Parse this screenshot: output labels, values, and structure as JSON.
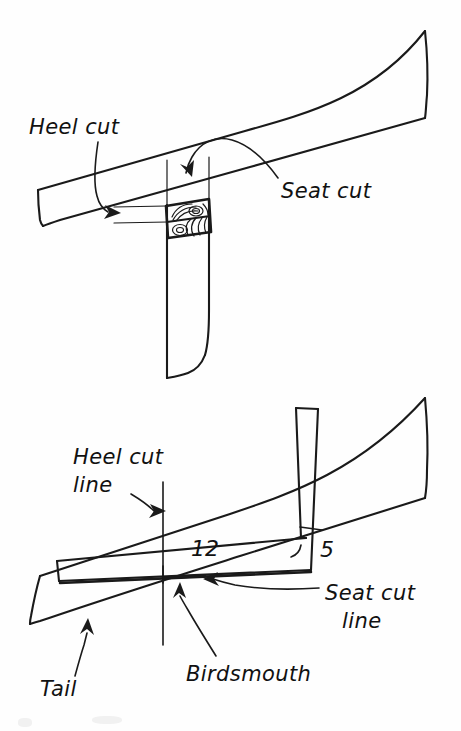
{
  "figure": {
    "style": "hand-drawn pen-and-ink line illustration",
    "background_color": "#fefefe",
    "ink_color": "#1a1a1a"
  },
  "panels": [
    {
      "id": "upper",
      "description": "Perspective view of a sloped rafter seated on a vertical wall top plate with a birdsmouth notch showing end grain",
      "labels": [
        "heel_cut",
        "seat_cut"
      ]
    },
    {
      "id": "lower",
      "description": "Framing square laid across a sloped rafter marking the heel cut line and seat cut line of the birdsmouth",
      "labels": [
        "heel_cut_line",
        "seat_cut_line",
        "birdsmouth",
        "tail",
        "twelve",
        "five"
      ]
    }
  ],
  "labels": {
    "heel_cut": "Heel cut",
    "seat_cut": "Seat cut",
    "heel_cut_line_1": "Heel cut",
    "heel_cut_line_2": "line",
    "seat_cut_line_1": "Seat cut",
    "seat_cut_line_2": "line",
    "birdsmouth": "Birdsmouth",
    "tail": "Tail"
  },
  "measurements": {
    "run": "12",
    "rise": "5",
    "run_meaning": "framing square blade reading on the rafter run",
    "rise_meaning": "framing square tongue reading for the roof rise"
  },
  "annotations": {
    "upper_heel_arrow": "curved arrow pointing right to the heel cut face",
    "upper_seat_arrow": "curved arrow arcing left and pointing down at the seat cut",
    "lower_heel_arrow": "curved arrow pointing right to the vertical heel cut line",
    "lower_seat_arrow": "curved arrow pointing left to the horizontal seat cut line",
    "birdsmouth_arrow": "arrow pointing up to the birdsmouth notch vertex",
    "tail_arrow": "arrow pointing up to the rafter tail"
  }
}
